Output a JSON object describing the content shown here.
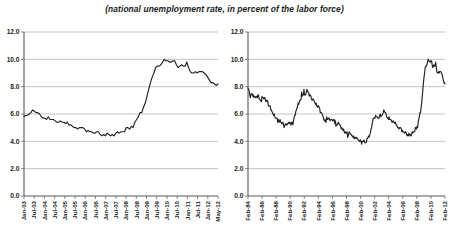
{
  "figure": {
    "title": "(national unemployment rate, in percent of the labor force)"
  },
  "chart_data": [
    {
      "id": "left",
      "type": "line",
      "title": "",
      "xlabel": "",
      "ylabel": "",
      "ylim": [
        0.0,
        12.0
      ],
      "yticks": [
        0.0,
        2.0,
        4.0,
        6.0,
        8.0,
        10.0,
        12.0
      ],
      "ytick_labels": [
        "0.0",
        "2.0",
        "4.0",
        "6.0",
        "8.0",
        "10.0",
        "12.0"
      ],
      "grid": true,
      "legend": "none",
      "xtick_labels": [
        "Jan-03",
        "Jul-03",
        "Jan-04",
        "Jul-04",
        "Jan-05",
        "Jul-05",
        "Jan-06",
        "Jul-06",
        "Jan-07",
        "Jul-07",
        "Jan-08",
        "Jul-08",
        "Jan-09",
        "Jul-09",
        "Jan-10",
        "Jul-10",
        "Jan-11",
        "Jul-11",
        "Jan-12",
        "May-12"
      ],
      "x_start": "Jan-03",
      "x_end": "May-12",
      "series": [
        {
          "name": "national unemployment rate",
          "color": "#231f20",
          "values": [
            5.8,
            5.9,
            5.9,
            6.0,
            6.1,
            6.3,
            6.2,
            6.1,
            6.1,
            6.0,
            5.8,
            5.7,
            5.7,
            5.6,
            5.8,
            5.6,
            5.6,
            5.6,
            5.5,
            5.4,
            5.4,
            5.5,
            5.4,
            5.4,
            5.3,
            5.4,
            5.2,
            5.2,
            5.1,
            5.0,
            5.0,
            4.9,
            5.0,
            5.0,
            5.0,
            4.9,
            4.7,
            4.8,
            4.7,
            4.7,
            4.6,
            4.6,
            4.7,
            4.7,
            4.5,
            4.4,
            4.5,
            4.4,
            4.6,
            4.5,
            4.4,
            4.5,
            4.4,
            4.6,
            4.7,
            4.6,
            4.7,
            4.7,
            4.7,
            5.0,
            5.0,
            4.9,
            5.1,
            5.0,
            5.4,
            5.6,
            5.8,
            6.1,
            6.1,
            6.5,
            6.8,
            7.3,
            7.8,
            8.3,
            8.7,
            9.0,
            9.4,
            9.5,
            9.5,
            9.6,
            9.8,
            10.0,
            9.9,
            9.9,
            9.8,
            9.8,
            9.9,
            9.9,
            9.6,
            9.4,
            9.5,
            9.6,
            9.5,
            9.5,
            9.8,
            9.4,
            9.1,
            9.0,
            9.0,
            9.1,
            9.0,
            9.1,
            9.1,
            9.1,
            9.0,
            8.9,
            8.7,
            8.5,
            8.3,
            8.3,
            8.2,
            8.1,
            8.2
          ]
        }
      ]
    },
    {
      "id": "right",
      "type": "line",
      "title": "",
      "xlabel": "",
      "ylabel": "",
      "ylim": [
        0.0,
        12.0
      ],
      "yticks": [
        0.0,
        2.0,
        4.0,
        6.0,
        8.0,
        10.0,
        12.0
      ],
      "ytick_labels": [
        "0.0",
        "2.0",
        "4.0",
        "6.0",
        "8.0",
        "10.0",
        "12.0"
      ],
      "grid": true,
      "legend": "none",
      "xtick_labels": [
        "Feb-84",
        "Feb-86",
        "Feb-88",
        "Feb-90",
        "Feb-92",
        "Feb-94",
        "Feb-96",
        "Feb-98",
        "Feb-00",
        "Feb-02",
        "Feb-04",
        "Feb-06",
        "Feb-08",
        "Feb-10",
        "Feb-12"
      ],
      "x_start": "Feb-84",
      "x_end": "Feb-12",
      "series": [
        {
          "name": "national unemployment rate",
          "color": "#231f20",
          "values": [
            7.9,
            7.8,
            7.7,
            7.4,
            7.2,
            7.4,
            7.5,
            7.5,
            7.3,
            7.4,
            7.2,
            7.3,
            7.3,
            7.2,
            7.2,
            7.3,
            7.2,
            7.4,
            7.4,
            7.1,
            7.1,
            7.0,
            7.0,
            6.9,
            7.3,
            7.2,
            7.2,
            7.1,
            7.2,
            7.2,
            7.0,
            6.9,
            7.0,
            7.0,
            6.9,
            6.6,
            6.6,
            6.6,
            6.6,
            6.3,
            6.3,
            6.2,
            6.1,
            6.0,
            5.9,
            6.0,
            5.8,
            5.7,
            5.7,
            5.7,
            5.7,
            5.4,
            5.6,
            5.4,
            5.4,
            5.6,
            5.4,
            5.4,
            5.3,
            5.3,
            5.4,
            5.2,
            5.0,
            5.2,
            5.2,
            5.3,
            5.2,
            5.2,
            5.3,
            5.3,
            5.4,
            5.3,
            5.4,
            5.3,
            5.2,
            5.4,
            5.4,
            5.2,
            5.5,
            5.7,
            5.9,
            5.9,
            6.2,
            6.3,
            6.4,
            6.6,
            6.8,
            6.7,
            6.9,
            7.0,
            7.0,
            7.1,
            7.6,
            7.3,
            7.4,
            7.4,
            7.8,
            7.4,
            7.4,
            7.4,
            7.6,
            7.8,
            7.7,
            7.6,
            7.6,
            7.3,
            7.4,
            7.4,
            7.3,
            7.1,
            7.0,
            7.1,
            7.1,
            7.0,
            6.9,
            6.8,
            6.7,
            6.8,
            6.6,
            6.5,
            6.6,
            6.6,
            6.5,
            6.4,
            6.1,
            6.1,
            6.1,
            6.0,
            5.9,
            5.8,
            5.6,
            5.5,
            5.6,
            5.4,
            5.4,
            5.8,
            5.6,
            5.6,
            5.7,
            5.7,
            5.6,
            5.5,
            5.6,
            5.6,
            5.6,
            5.5,
            5.5,
            5.6,
            5.6,
            5.3,
            5.5,
            5.1,
            5.2,
            5.2,
            5.3,
            5.4,
            5.3,
            5.2,
            5.2,
            5.1,
            4.9,
            5.0,
            4.9,
            4.8,
            4.9,
            4.7,
            4.6,
            4.7,
            4.6,
            4.6,
            4.7,
            4.3,
            4.4,
            4.6,
            4.7,
            4.6,
            4.5,
            4.5,
            4.4,
            4.4,
            4.3,
            4.4,
            4.2,
            4.3,
            4.2,
            4.3,
            4.3,
            4.2,
            4.2,
            4.1,
            4.1,
            4.0,
            4.0,
            4.1,
            4.0,
            3.8,
            4.0,
            4.0,
            4.0,
            4.1,
            3.9,
            3.9,
            3.9,
            3.9,
            4.2,
            4.2,
            4.3,
            4.4,
            4.3,
            4.5,
            4.6,
            4.9,
            5.0,
            5.3,
            5.5,
            5.7,
            5.7,
            5.7,
            5.7,
            5.9,
            5.8,
            5.8,
            5.8,
            5.7,
            5.7,
            5.7,
            5.9,
            6.0,
            5.8,
            5.9,
            5.9,
            6.0,
            6.1,
            6.3,
            6.2,
            6.1,
            6.1,
            6.0,
            5.8,
            5.7,
            5.7,
            5.6,
            5.8,
            5.6,
            5.6,
            5.6,
            5.5,
            5.4,
            5.4,
            5.5,
            5.4,
            5.4,
            5.3,
            5.4,
            5.2,
            5.2,
            5.1,
            5.0,
            5.0,
            4.9,
            5.0,
            5.0,
            5.0,
            4.9,
            4.7,
            4.8,
            4.7,
            4.7,
            4.6,
            4.6,
            4.7,
            4.7,
            4.5,
            4.4,
            4.5,
            4.4,
            4.6,
            4.5,
            4.4,
            4.5,
            4.4,
            4.6,
            4.7,
            4.6,
            4.7,
            4.7,
            4.7,
            5.0,
            5.0,
            4.9,
            5.1,
            5.0,
            5.4,
            5.6,
            5.8,
            6.1,
            6.1,
            6.5,
            6.8,
            7.3,
            7.8,
            8.3,
            8.7,
            9.0,
            9.4,
            9.5,
            9.5,
            9.6,
            9.8,
            10.0,
            9.9,
            9.9,
            9.8,
            9.8,
            9.9,
            9.9,
            9.6,
            9.4,
            9.5,
            9.6,
            9.5,
            9.5,
            9.8,
            9.4,
            9.1,
            9.0,
            9.0,
            9.1,
            9.0,
            9.1,
            9.1,
            9.1,
            9.0,
            8.9,
            8.7,
            8.5,
            8.3,
            8.3,
            8.2
          ]
        }
      ]
    }
  ]
}
